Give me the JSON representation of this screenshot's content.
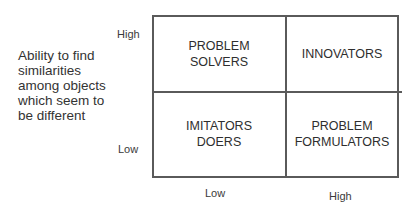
{
  "diagram": {
    "type": "2x2 matrix",
    "y_axis": {
      "label": "Ability to find similarities among objects which seem to be different",
      "ticks": {
        "high": "High",
        "low": "Low"
      }
    },
    "x_axis": {
      "label": "",
      "ticks": {
        "low": "Low",
        "high": "High"
      }
    },
    "quadrants": {
      "top_left": "PROBLEM\nSOLVERS",
      "top_right": "INNOVATORS",
      "bottom_left": "IMITATORS\nDOERS",
      "bottom_right": "PROBLEM\nFORMULATORS"
    },
    "colors": {
      "line": "#5a5a5a",
      "text": "#2e2e2e",
      "background": "#ffffff"
    }
  }
}
